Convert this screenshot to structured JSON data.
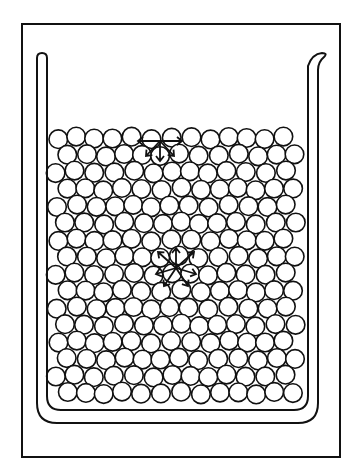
{
  "figure": {
    "stroke_color": "#111111",
    "background": "#ffffff",
    "frame": {
      "x": 22,
      "y": 24,
      "w": 318,
      "h": 433
    },
    "beaker": {
      "outer_left": 37,
      "inner_left": 47,
      "outer_right": 318,
      "inner_right": 308,
      "top": 58,
      "outer_bottom": 423,
      "inner_bottom": 410,
      "spout": true
    },
    "molecules": {
      "radius": 9.3,
      "spacing": 19,
      "row_height": 17,
      "top_row_y": 138,
      "bottom_row_y": 400,
      "left_x": 57,
      "right_x": 300
    },
    "force_groups": [
      {
        "name": "surface-molecule",
        "center": [
          160,
          141
        ],
        "arrows": [
          [
            -22,
            0
          ],
          [
            22,
            0
          ],
          [
            -14,
            15
          ],
          [
            0,
            20
          ],
          [
            14,
            15
          ]
        ]
      },
      {
        "name": "interior-molecule",
        "center": [
          176,
          268
        ],
        "arrows": [
          [
            -18,
            -16
          ],
          [
            0,
            -20
          ],
          [
            18,
            -16
          ],
          [
            -20,
            6
          ],
          [
            20,
            6
          ],
          [
            -12,
            18
          ],
          [
            12,
            18
          ]
        ]
      }
    ]
  }
}
